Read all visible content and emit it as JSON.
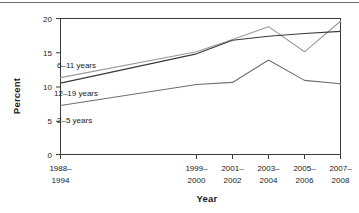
{
  "chart_data": {
    "type": "line",
    "title": "",
    "xlabel": "Year",
    "ylabel": "Percent",
    "ylim": [
      0,
      20
    ],
    "yticks": [
      0,
      5,
      10,
      15,
      20
    ],
    "ytick_labels": [
      "0",
      "5",
      "10",
      "15",
      "20"
    ],
    "grid": false,
    "legend": "inline-labels",
    "categories": [
      "1988–1994",
      "1999–2000",
      "2001–2002",
      "2003–2004",
      "2005–2006",
      "2007–2008"
    ],
    "category_lines": [
      [
        "1988–",
        "1994"
      ],
      [
        "1999–",
        "2000"
      ],
      [
        "2001–",
        "2002"
      ],
      [
        "2003–",
        "2004"
      ],
      [
        "2005–",
        "2006"
      ],
      [
        "2007–",
        "2008"
      ]
    ],
    "series": [
      {
        "name": "6–11 years",
        "color": "#9a9a9a",
        "values": [
          11.3,
          15.1,
          16.9,
          18.8,
          15.1,
          19.6
        ]
      },
      {
        "name": "12–19 years",
        "color": "#3a3a3a",
        "values": [
          10.5,
          14.8,
          16.8,
          17.4,
          17.8,
          18.1
        ]
      },
      {
        "name": "2–5 years",
        "color": "#6f6f6f",
        "values": [
          7.2,
          10.3,
          10.6,
          13.9,
          10.9,
          10.4
        ]
      }
    ],
    "series_label_positions": [
      {
        "name": "6–11 years",
        "x": 57,
        "y": 65
      },
      {
        "name": "12–19 years",
        "x": 54,
        "y": 93
      },
      {
        "name": "2–5 years",
        "x": 57,
        "y": 120
      }
    ]
  }
}
